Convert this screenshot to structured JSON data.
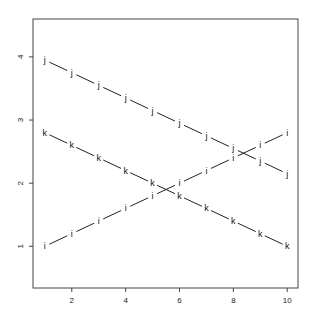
{
  "chart_data": {
    "type": "line",
    "title": "",
    "xlabel": "",
    "ylabel": "",
    "xlim": [
      0.56,
      10.4
    ],
    "ylim": [
      0.34,
      4.6
    ],
    "grid": false,
    "legend": null,
    "x": [
      1,
      2,
      3,
      4,
      5,
      6,
      7,
      8,
      9,
      10
    ],
    "x_ticks": [
      2,
      4,
      6,
      8,
      10
    ],
    "y_ticks": [
      1,
      2,
      3,
      4
    ],
    "series": [
      {
        "name": "j",
        "marker": "j",
        "values": [
          3.95,
          3.75,
          3.55,
          3.35,
          3.15,
          2.95,
          2.75,
          2.55,
          2.35,
          2.15
        ]
      },
      {
        "name": "k",
        "marker": "k",
        "values": [
          2.8,
          2.6,
          2.4,
          2.2,
          2.0,
          1.8,
          1.6,
          1.4,
          1.2,
          1.0
        ]
      },
      {
        "name": "i",
        "marker": "i",
        "values": [
          1.0,
          1.2,
          1.4,
          1.6,
          1.8,
          2.0,
          2.2,
          2.4,
          2.6,
          2.8
        ]
      }
    ],
    "colors": {
      "line": "#222222",
      "axis": "#444444"
    }
  }
}
